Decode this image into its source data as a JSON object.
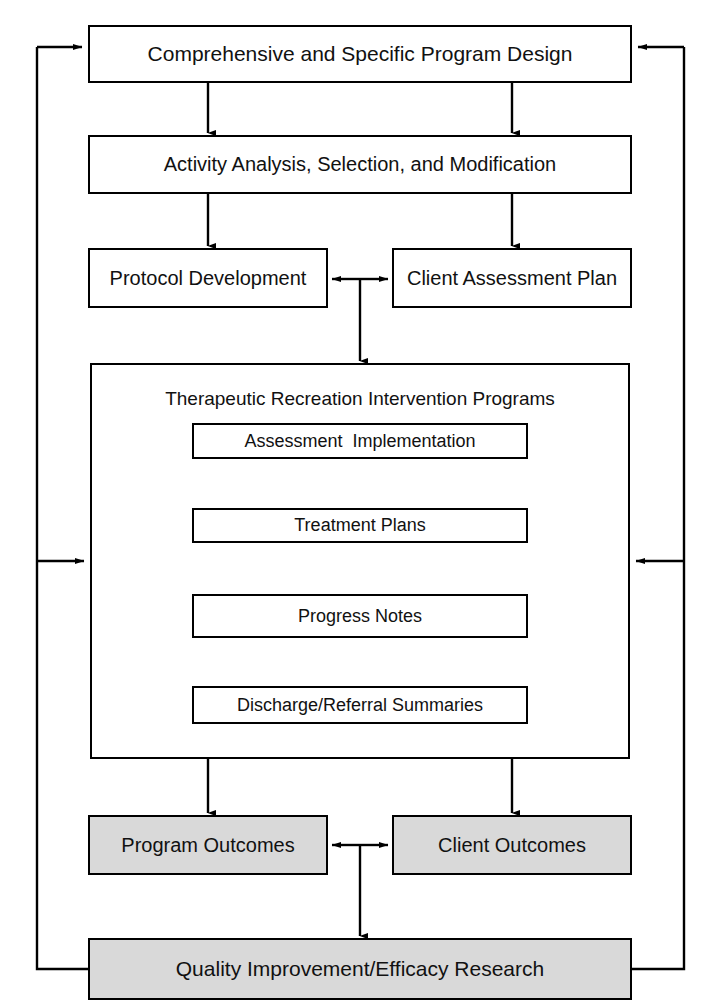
{
  "diagram": {
    "title_text": "Therapeutic Recreation Program Design and Evaluation Flowchart",
    "colors": {
      "stroke": "#000000",
      "fill_plain": "#ffffff",
      "fill_shaded": "#d9d9d9",
      "text": "#111111"
    },
    "nodes": {
      "program_design": "Comprehensive and Specific Program Design",
      "activity_analysis": "Activity Analysis, Selection, and Modification",
      "protocol_development": "Protocol Development",
      "client_assessment_plan": "Client Assessment Plan",
      "intervention_programs": "Therapeutic Recreation Intervention Programs",
      "assessment_implementation": "Assessment  Implementation",
      "treatment_plans": "Treatment Plans",
      "progress_notes": "Progress Notes",
      "discharge_referral": "Discharge/Referral Summaries",
      "program_outcomes": "Program Outcomes",
      "client_outcomes": "Client Outcomes",
      "quality_improvement": "Quality Improvement/Efficacy Research"
    },
    "connectors": [
      {
        "name": "design-to-activity-left",
        "kind": "arrow-down"
      },
      {
        "name": "design-to-activity-right",
        "kind": "arrow-down"
      },
      {
        "name": "activity-to-protocol",
        "kind": "arrow-down"
      },
      {
        "name": "activity-to-client-plan",
        "kind": "arrow-down"
      },
      {
        "name": "protocol-clientplan-bidirectional",
        "kind": "arrow-both-horizontal"
      },
      {
        "name": "plans-junction-to-intervention",
        "kind": "arrow-down"
      },
      {
        "name": "assessment-to-treatment",
        "kind": "arrow-down"
      },
      {
        "name": "treatment-to-progress",
        "kind": "arrow-down"
      },
      {
        "name": "progress-to-discharge",
        "kind": "arrow-down"
      },
      {
        "name": "intervention-to-program-outcomes",
        "kind": "arrow-down"
      },
      {
        "name": "intervention-to-client-outcomes",
        "kind": "arrow-down"
      },
      {
        "name": "outcomes-bidirectional",
        "kind": "arrow-both-horizontal"
      },
      {
        "name": "outcomes-junction-to-quality",
        "kind": "arrow-down"
      },
      {
        "name": "left-feedback-to-design",
        "kind": "feedback-arrow-right"
      },
      {
        "name": "left-feedback-to-intervention",
        "kind": "feedback-arrow-right"
      },
      {
        "name": "right-feedback-to-design",
        "kind": "feedback-arrow-left"
      },
      {
        "name": "right-feedback-to-intervention",
        "kind": "feedback-arrow-left"
      }
    ]
  }
}
